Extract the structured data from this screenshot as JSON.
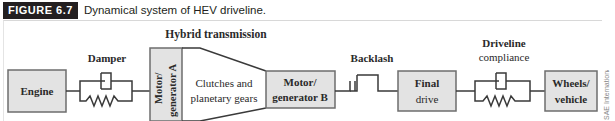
{
  "caption": {
    "label": "FIGURE 6.7",
    "title": "Dynamical system of HEV driveline."
  },
  "diagram": {
    "group_label": "Hybrid transmission",
    "blocks": {
      "engine": "Engine",
      "mga_line1": "Motor/",
      "mga_line2": "generator A",
      "clutch_line1": "Clutches and",
      "clutch_line2": "planetary gears",
      "mgb_line1": "Motor/",
      "mgb_line2": "generator B",
      "final_line1": "Final",
      "final_line2": "drive",
      "wheels_line1": "Wheels/",
      "wheels_line2": "vehicle"
    },
    "elements": {
      "damper": "Damper",
      "backlash": "Backlash",
      "compliance_line1": "Driveline",
      "compliance_line2": "compliance"
    },
    "colors": {
      "block_fill": "#e3e3e3",
      "block_stroke": "#6d6d6d",
      "line": "#3a3a3a",
      "text": "#2a2a2a"
    }
  },
  "credit": "SAE International"
}
